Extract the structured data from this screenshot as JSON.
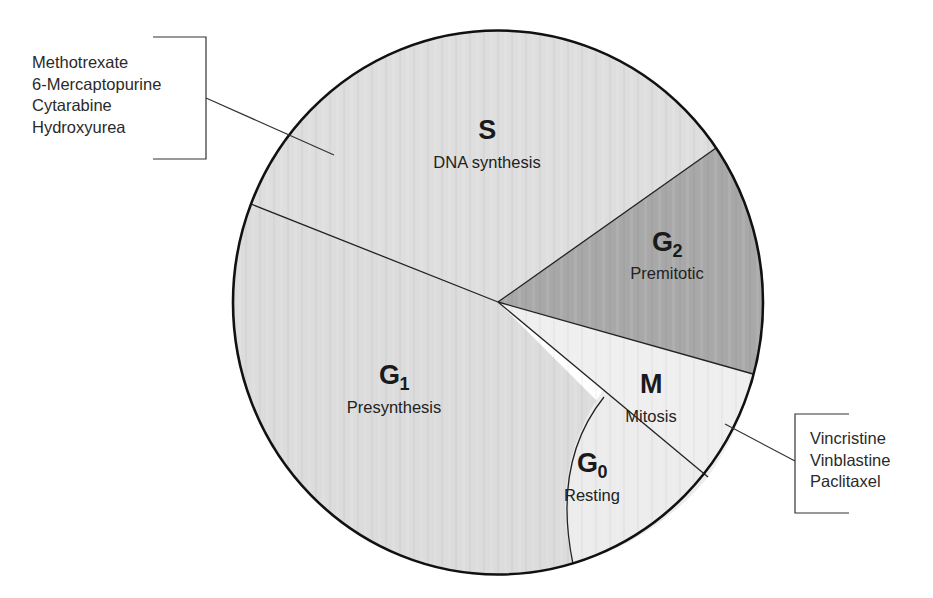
{
  "diagram": {
    "colors": {
      "S": "#dcdcdc",
      "G1": "#dcdcdc",
      "G2": "#a9a9a9",
      "M": "#eeeeee",
      "G0": "#ebebeb",
      "outline": "#111111"
    },
    "phases": [
      {
        "id": "S",
        "symbol": "S",
        "subscript": "",
        "description": "DNA synthesis"
      },
      {
        "id": "G2",
        "symbol": "G",
        "subscript": "2",
        "description": "Premitotic"
      },
      {
        "id": "M",
        "symbol": "M",
        "subscript": "",
        "description": "Mitosis"
      },
      {
        "id": "G0",
        "symbol": "G",
        "subscript": "0",
        "description": "Resting"
      },
      {
        "id": "G1",
        "symbol": "G",
        "subscript": "1",
        "description": "Presynthesis"
      }
    ],
    "drug_groups": [
      {
        "target_phase": "S",
        "drugs": [
          "Methotrexate",
          "6-Mercaptopurine",
          "Cytarabine",
          "Hydroxyurea"
        ]
      },
      {
        "target_phase": "M",
        "drugs": [
          "Vincristine",
          "Vinblastine",
          "Paclitaxel"
        ]
      }
    ]
  }
}
